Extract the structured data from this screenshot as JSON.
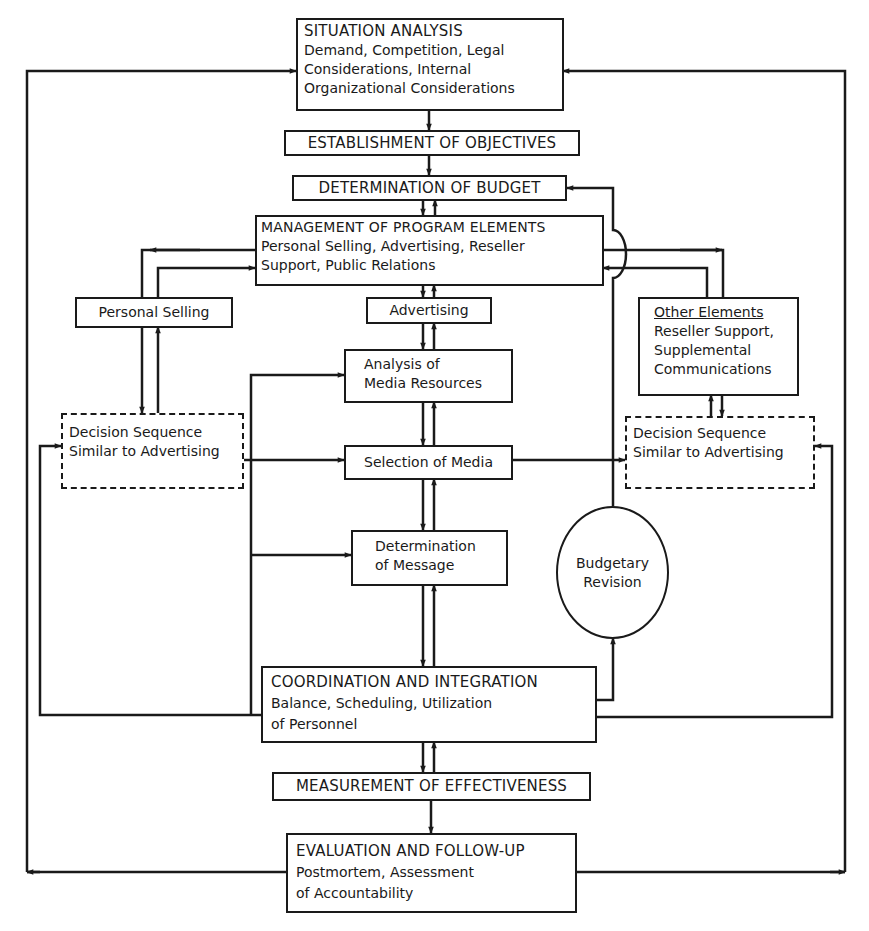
{
  "nodes": {
    "situation": {
      "title": "SITUATION ANALYSIS",
      "lines": [
        "Demand, Competition, Legal",
        "Considerations, Internal",
        "Organizational Considerations"
      ]
    },
    "objectives": {
      "title": "ESTABLISHMENT OF OBJECTIVES"
    },
    "budget": {
      "title": "DETERMINATION OF BUDGET"
    },
    "management": {
      "title": "MANAGEMENT OF PROGRAM ELEMENTS",
      "lines": [
        "Personal Selling, Advertising, Reseller",
        "Support, Public Relations"
      ]
    },
    "personal_selling": {
      "title": "Personal Selling"
    },
    "advertising": {
      "title": "Advertising"
    },
    "other_elements": {
      "title": "Other Elements",
      "lines": [
        "Reseller Support,",
        "Supplemental",
        "Communications"
      ]
    },
    "decision_left": {
      "lines": [
        "Decision Sequence",
        "Similar to Advertising"
      ]
    },
    "decision_right": {
      "lines": [
        "Decision Sequence",
        "Similar to Advertising"
      ]
    },
    "analysis_media": {
      "lines": [
        "Analysis of",
        "Media Resources"
      ]
    },
    "selection_media": {
      "title": "Selection of Media"
    },
    "determination_message": {
      "lines": [
        "Determination",
        "of Message"
      ]
    },
    "budgetary_revision": {
      "lines": [
        "Budgetary",
        "Revision"
      ]
    },
    "coordination": {
      "title": "COORDINATION AND INTEGRATION",
      "lines": [
        "Balance, Scheduling, Utilization",
        "of Personnel"
      ]
    },
    "measurement": {
      "title": "MEASUREMENT OF EFFECTIVENESS"
    },
    "evaluation": {
      "title": "EVALUATION AND FOLLOW-UP",
      "lines": [
        "Postmortem, Assessment",
        "of Accountability"
      ]
    }
  },
  "colors": {
    "line": "#1a1a1a",
    "background": "#ffffff"
  }
}
